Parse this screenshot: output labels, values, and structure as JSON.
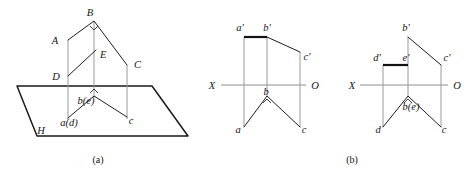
{
  "figure": {
    "title_a": "(a)",
    "title_b": "(b)"
  },
  "pictorial": {
    "caption": "(a)",
    "plane_label": "H",
    "space_points": [
      {
        "name": "A",
        "label": "A",
        "x": 68,
        "y": 40
      },
      {
        "name": "B",
        "label": "B",
        "x": 94,
        "y": 21
      },
      {
        "name": "C",
        "label": "C",
        "x": 127,
        "y": 65
      },
      {
        "name": "D",
        "label": "D",
        "x": 68,
        "y": 76
      },
      {
        "name": "E",
        "label": "E",
        "x": 94,
        "y": 52
      }
    ],
    "projected_points": [
      {
        "name": "a(d)",
        "label": "a(d)",
        "x": 68,
        "y": 118
      },
      {
        "name": "b(e)",
        "label": "b(e)",
        "x": 94,
        "y": 96
      },
      {
        "name": "c",
        "label": "c",
        "x": 127,
        "y": 117
      }
    ],
    "label_texts": {
      "A": "A",
      "B": "B",
      "C": "C",
      "D": "D",
      "E": "E",
      "H": "H",
      "a_d": "a(d)",
      "b_e": "b(e)",
      "c": "c"
    }
  },
  "projection_front": {
    "caption": "",
    "axis": {
      "left_label": "X",
      "right_label": "O",
      "y": 85
    },
    "upper_points": [
      {
        "name": "a'",
        "label": "a'",
        "x": 244,
        "y": 37
      },
      {
        "name": "b'",
        "label": "b'",
        "x": 267,
        "y": 37
      },
      {
        "name": "c'",
        "label": "c'",
        "x": 300,
        "y": 52
      }
    ],
    "lower_points": [
      {
        "name": "a",
        "label": "a",
        "x": 244,
        "y": 127
      },
      {
        "name": "b",
        "label": "b",
        "x": 267,
        "y": 96
      },
      {
        "name": "c",
        "label": "c",
        "x": 300,
        "y": 127
      }
    ],
    "label_texts": {
      "a_prime": "a'",
      "b_prime": "b'",
      "c_prime": "c'",
      "a": "a",
      "b": "b",
      "c": "c",
      "X": "X",
      "O": "O"
    }
  },
  "projection_second": {
    "caption": "(b)",
    "axis": {
      "left_label": "X",
      "right_label": "O",
      "y": 85
    },
    "upper_points": [
      {
        "name": "b'",
        "label": "b'",
        "x": 408,
        "y": 37
      },
      {
        "name": "d'",
        "label": "d'",
        "x": 383,
        "y": 65
      },
      {
        "name": "e'",
        "label": "e'",
        "x": 408,
        "y": 65
      },
      {
        "name": "c'",
        "label": "c'",
        "x": 441,
        "y": 65
      }
    ],
    "lower_points": [
      {
        "name": "d",
        "label": "d",
        "x": 383,
        "y": 127
      },
      {
        "name": "b(e)",
        "label": "b(e)",
        "x": 408,
        "y": 96
      },
      {
        "name": "c",
        "label": "c",
        "x": 441,
        "y": 127
      }
    ],
    "label_texts": {
      "b_prime": "b'",
      "d_prime": "d'",
      "e_prime": "e'",
      "c_prime": "c'",
      "d": "d",
      "b_e": "b(e)",
      "c": "c",
      "X": "X",
      "O": "O"
    }
  },
  "colors": {
    "ink": "#1a1a1a",
    "thin_ink": "#1e1e1e",
    "projector": "#9a9a9a",
    "axis": "#8e8e8e",
    "background": "#ffffff"
  }
}
